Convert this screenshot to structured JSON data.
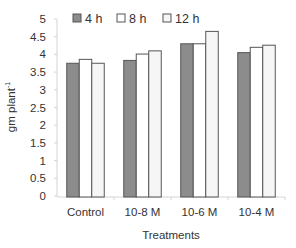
{
  "chart_data": {
    "type": "bar",
    "title": "",
    "xlabel": "Treatments",
    "ylabel": "gm plant",
    "ylabel_superscript": "-1",
    "ylim": [
      0,
      5
    ],
    "yticks": [
      "0",
      "0.5",
      "1",
      "1.5",
      "2",
      "2.5",
      "3",
      "3.5",
      "4",
      "4.5",
      "5"
    ],
    "grid": false,
    "legend_position": "top",
    "categories": [
      "Control",
      "10-8 M",
      "10-6 M",
      "10-4 M"
    ],
    "series": [
      {
        "name": "4 h",
        "color": "#8c8c8c",
        "values": [
          3.75,
          3.83,
          4.3,
          4.05
        ]
      },
      {
        "name": "8 h",
        "color": "#ffffff",
        "values": [
          3.86,
          4.01,
          4.3,
          4.2
        ]
      },
      {
        "name": "12 h",
        "color": "#f6f6f6",
        "values": [
          3.75,
          4.1,
          4.65,
          4.26
        ]
      }
    ]
  },
  "legend": {
    "items": [
      {
        "label": "4 h",
        "color": "#8c8c8c"
      },
      {
        "label": "8 h",
        "color": "#ffffff"
      },
      {
        "label": "12 h",
        "color": "#f6f6f6"
      }
    ]
  },
  "axes": {
    "x_title": "Treatments",
    "y_title": "gm plant",
    "y_title_sup": "-1"
  }
}
